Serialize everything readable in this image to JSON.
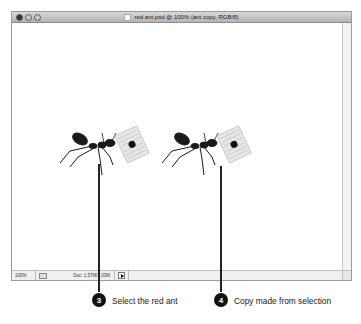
{
  "window": {
    "title": "red ant.psd @ 100% (ant copy, RGB/8)",
    "controls": [
      "close",
      "minimize",
      "zoom"
    ]
  },
  "status_bar": {
    "zoom_level": "100%",
    "doc_info": "Doc: 1.57M/1.03M"
  },
  "canvas": {
    "objects": [
      {
        "name": "original-ant",
        "description": "Ant carrying a card"
      },
      {
        "name": "ant-copy",
        "description": "Copy of ant carrying a card"
      }
    ]
  },
  "callouts": [
    {
      "number": "3",
      "text": "Select the red ant"
    },
    {
      "number": "4",
      "text": "Copy made from selection"
    }
  ]
}
